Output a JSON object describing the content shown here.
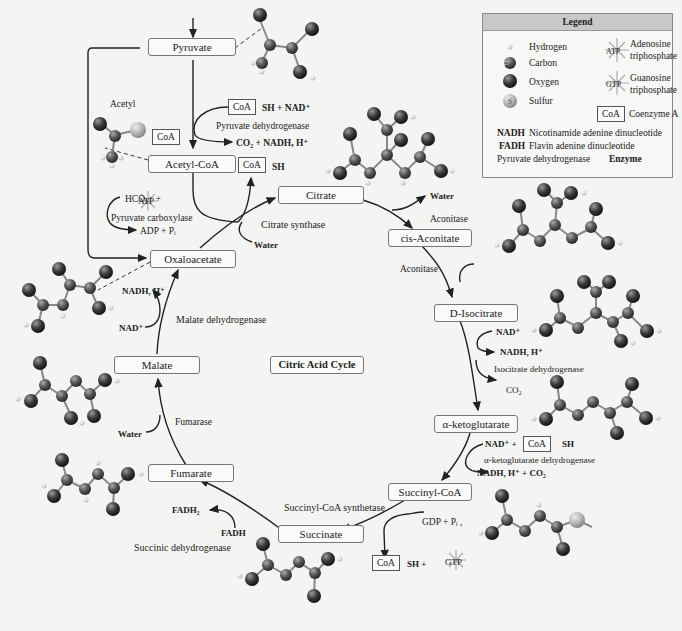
{
  "title": "Citric Acid Cycle",
  "legend": {
    "heading": "Legend",
    "atoms": [
      {
        "symbol": "",
        "label": "Hydrogen"
      },
      {
        "symbol": "C",
        "label": "Carbon"
      },
      {
        "symbol": "O",
        "label": "Oxygen"
      },
      {
        "symbol": "S",
        "label": "Sulfur"
      }
    ],
    "molecules": [
      {
        "symbol": "ATP",
        "label_line1": "Adenosine",
        "label_line2": "triphosphate"
      },
      {
        "symbol": "GTP",
        "label_line1": "Guanosine",
        "label_line2": "triphosphate"
      },
      {
        "symbol": "CoA",
        "label_line1": "Coenzyme A",
        "label_line2": ""
      }
    ],
    "abbreviations": [
      {
        "abbr": "NADH",
        "text": "Nicotinamide adenine dinucleotide"
      },
      {
        "abbr": "FADH",
        "text": "Flavin adenine dinucleotide"
      }
    ],
    "enzyme_example": {
      "text": "Pyruvate dehydrogenase",
      "bold": "Enzyme"
    }
  },
  "compounds": {
    "pyruvate": "Pyruvate",
    "acetyl_coa": "Acetyl-CoA",
    "citrate": "Citrate",
    "cis_aconitate": "cis-Aconitate",
    "d_isocitrate": "D-Isocitrate",
    "alpha_ketoglutarate": "α-ketoglutarate",
    "succinyl_coa": "Succinyl-CoA",
    "succinate": "Succinate",
    "fumarate": "Fumarate",
    "malate": "Malate",
    "oxaloacetate": "Oxaloacetate"
  },
  "enzymes": {
    "pyruvate_dehydrogenase": "Pyruvate dehydrogenase",
    "pyruvate_carboxylase": "Pyruvate carboxylase",
    "citrate_synthase": "Citrate synthase",
    "aconitase_1": "Aconitase",
    "aconitase_2": "Aconitase",
    "isocitrate_dehydrogenase": "Isocitrate dehydrogenase",
    "akg_dehydrogenase": "α-ketoglutarate dehydrogenase",
    "succinyl_coa_synthetase": "Succinyl-CoA synthetase",
    "succinic_dehydrogenase": "Succinic dehydrogenase",
    "fumarase": "Fumarase",
    "malate_dehydrogenase": "Malate dehydrogenase"
  },
  "reactants": {
    "acetyl_label": "Acetyl",
    "coa": "CoA",
    "sh_nad": "SH + NAD⁺",
    "co2_nadh": "CO₂ + NADH, H⁺",
    "sh": "SH",
    "hco3": "HCO₃⁻ +",
    "atp": "ATP",
    "adp_pi": "ADP + Pᵢ",
    "water_citrate_in": "Water",
    "water_citrate_out": "Water",
    "water_aconitate": "Water",
    "nad_isocitrate": "NAD⁺",
    "nadh_isocitrate": "NADH, H⁺",
    "co2_isocitrate": "CO₂",
    "nad_akg": "NAD⁺ +",
    "sh_akg": "SH",
    "nadh_co2_akg": "NADH, H⁺ + CO₂",
    "gdp_pi": "GDP + Pᵢ ,",
    "sh_gtp": "SH +",
    "gtp": "GTP",
    "fadh2": "FADH₂",
    "fadh": "FADH",
    "water_fumarase": "Water",
    "nad_malate": "NAD⁺",
    "nadh_malate": "NADH, H⁺"
  },
  "colors": {
    "oxygen": "#3a3a3a",
    "carbon": "#555555",
    "sulfur": "#b0b0b0",
    "hydrogen": "#d8d8d8",
    "legend_header": "#c8c8c8",
    "background": "#f4f4f2"
  }
}
